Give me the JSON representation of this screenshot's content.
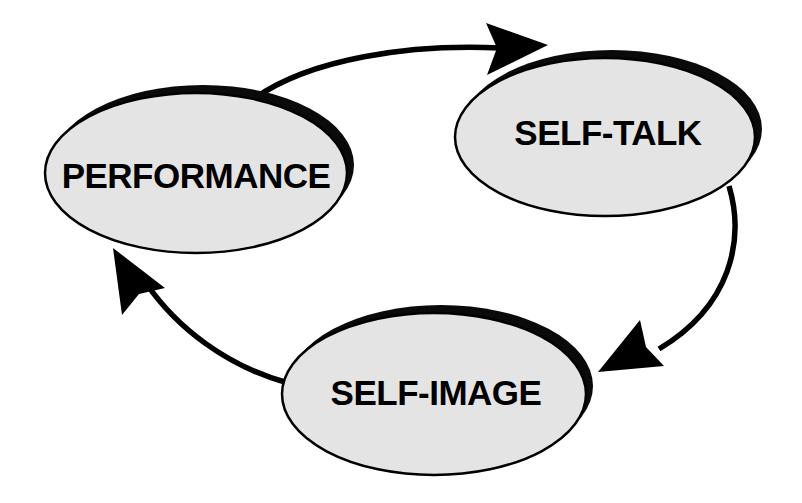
{
  "diagram": {
    "type": "cycle-diagram",
    "background_color": "#ffffff",
    "node_fill_color": "#e4e4e4",
    "node_stroke_color": "#000000",
    "node_shadow_color": "#0a0a0a",
    "edge_color": "#000000",
    "text_color": "#000000",
    "nodes": [
      {
        "id": "performance",
        "label": "PERFORMANCE",
        "shape": "ellipse",
        "cx": 196,
        "cy": 173,
        "rx": 151,
        "ry": 80
      },
      {
        "id": "self-talk",
        "label": "SELF-TALK",
        "shape": "ellipse",
        "cx": 605,
        "cy": 137,
        "rx": 150,
        "ry": 79
      },
      {
        "id": "self-image",
        "label": "SELF-IMAGE",
        "shape": "ellipse",
        "cx": 434,
        "cy": 394,
        "rx": 152,
        "ry": 81
      }
    ],
    "edges": [
      {
        "id": "performance-to-self-talk",
        "from": "performance",
        "to": "self-talk",
        "label": "",
        "arrow": "to"
      },
      {
        "id": "self-talk-to-self-image",
        "from": "self-talk",
        "to": "self-image",
        "label": "",
        "arrow": "to"
      },
      {
        "id": "self-image-to-performance",
        "from": "self-image",
        "to": "performance",
        "label": "",
        "arrow": "to"
      }
    ]
  }
}
